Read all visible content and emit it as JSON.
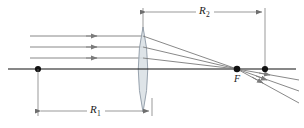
{
  "figure": {
    "background_color": "#ffffff",
    "width": 304,
    "height": 128
  },
  "labels": {
    "r1": {
      "symbol": "R",
      "subscript": "1"
    },
    "r2": {
      "symbol": "R",
      "subscript": "2"
    },
    "focal_point": "F"
  },
  "colors": {
    "axis": "#111111",
    "ray": "#7b7b7b",
    "lens_stroke": "#8e9aa6",
    "lens_fill": "#d8dfe4",
    "dimension": "#6e6e6e",
    "dot": "#111111"
  },
  "geometry": {
    "optical_axis": {
      "x1": 8,
      "y1": 69,
      "x2": 296,
      "y2": 69
    },
    "lens": {
      "center_x": 143,
      "top_y": 27,
      "bottom_y": 112,
      "bulge": 9
    },
    "focal_point": {
      "x": 237,
      "y": 69
    },
    "left_vertex_dot": {
      "x": 38,
      "y": 69
    },
    "right_dot": {
      "x": 265,
      "y": 69
    },
    "incoming_rays": [
      {
        "y": 36,
        "x_start": 30,
        "x_end": 143,
        "arrow_x": 96
      },
      {
        "y": 47,
        "x_start": 30,
        "x_end": 143,
        "arrow_x": 96
      },
      {
        "y": 58,
        "x_start": 30,
        "x_end": 143,
        "arrow_x": 96
      }
    ],
    "refracted_rays": [
      {
        "x1": 143,
        "y1": 36,
        "x2": 237,
        "y2": 69
      },
      {
        "x1": 143,
        "y1": 47,
        "x2": 237,
        "y2": 69
      },
      {
        "x1": 143,
        "y1": 58,
        "x2": 237,
        "y2": 69
      }
    ],
    "diverging_rays": [
      {
        "x1": 237,
        "y1": 69,
        "x2": 299,
        "y2": 91,
        "arrow_x": 272,
        "arrow_y": 81
      },
      {
        "x1": 237,
        "y1": 69,
        "x2": 299,
        "y2": 80,
        "arrow_x": 268,
        "arrow_y": 75
      },
      {
        "x1": 237,
        "y1": 69,
        "x2": 299,
        "y2": 102,
        "arrow_x": 265,
        "arrow_y": 84
      }
    ],
    "dimension_r1": {
      "y": 111,
      "x_left": 38,
      "x_right": 152,
      "label_x": 95,
      "label_y": 108
    },
    "dimension_r2": {
      "y": 12,
      "x_left": 143,
      "x_right": 265,
      "label_x": 204,
      "label_y": 9
    },
    "extension_lines": [
      {
        "x": 38,
        "y1": 69,
        "y2": 115
      },
      {
        "x": 152,
        "y1": 100,
        "y2": 115
      },
      {
        "x": 143,
        "y1": 8,
        "y2": 32
      },
      {
        "x": 265,
        "y1": 8,
        "y2": 69
      }
    ]
  }
}
